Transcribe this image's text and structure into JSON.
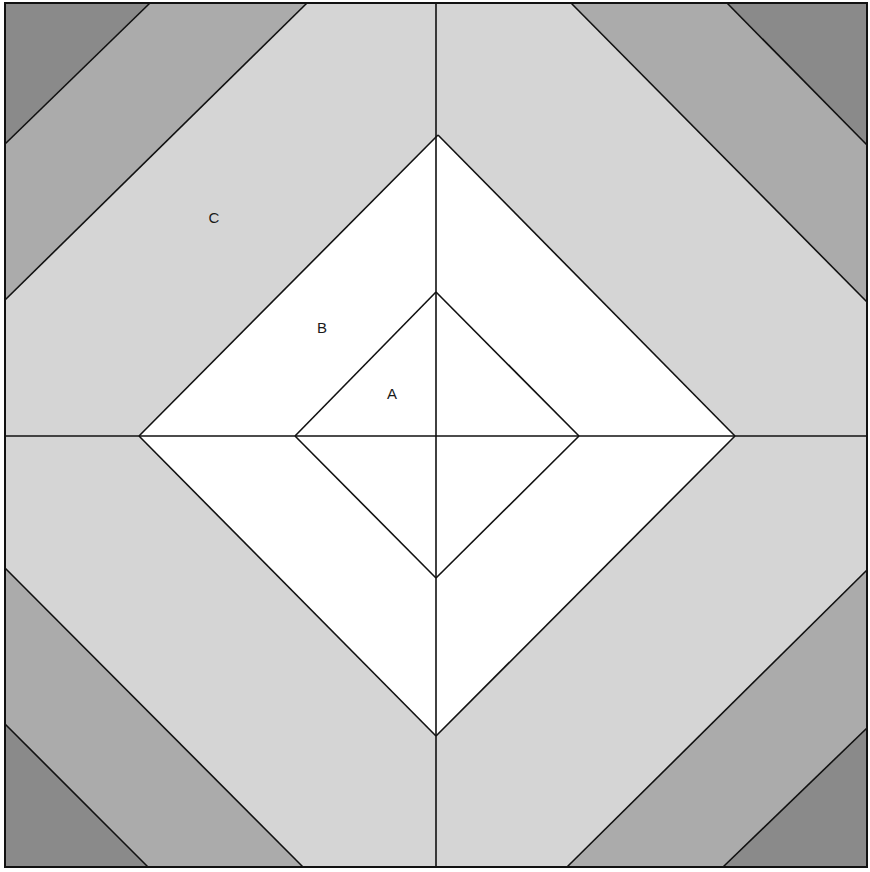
{
  "figure": {
    "width": 870,
    "height": 872,
    "stroke_color": "#111111",
    "colors": {
      "center": "#ffffff",
      "light_band": "#d5d5d5",
      "mid_band": "#ababab",
      "dark_corner": "#8a8a8a"
    },
    "outer_square": {
      "x1": 5,
      "y1": 3,
      "x2": 867,
      "y2": 867
    },
    "center": {
      "x": 436,
      "y": 436
    },
    "diamond_a": {
      "top": [
        436,
        292
      ],
      "right": [
        579,
        436
      ],
      "bottom": [
        436,
        578
      ],
      "left": [
        295,
        436
      ]
    },
    "diamond_b": {
      "top": [
        438,
        135
      ],
      "right": [
        735,
        436
      ],
      "bottom": [
        436,
        736
      ],
      "left": [
        139,
        436
      ]
    },
    "band_lines_inner": [
      [
        [
          5,
          300
        ],
        [
          307,
          3
        ]
      ],
      [
        [
          571,
          3
        ],
        [
          867,
          302
        ]
      ],
      [
        [
          867,
          570
        ],
        [
          567,
          867
        ]
      ],
      [
        [
          303,
          867
        ],
        [
          5,
          568
        ]
      ]
    ],
    "band_lines_outer": [
      [
        [
          5,
          144
        ],
        [
          150,
          3
        ]
      ],
      [
        [
          727,
          3
        ],
        [
          867,
          145
        ]
      ],
      [
        [
          867,
          728
        ],
        [
          723,
          867
        ]
      ],
      [
        [
          148,
          867
        ],
        [
          5,
          724
        ]
      ]
    ]
  },
  "labels": {
    "a": {
      "text": "A",
      "x": 392,
      "y": 393
    },
    "b": {
      "text": "B",
      "x": 322,
      "y": 327
    },
    "c": {
      "text": "C",
      "x": 214,
      "y": 217
    }
  }
}
